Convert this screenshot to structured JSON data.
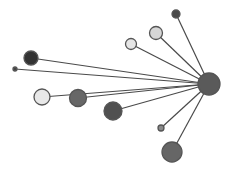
{
  "diagram": {
    "type": "star-network",
    "hub": {
      "id": "hub",
      "x": 209,
      "y": 84,
      "r": 11,
      "fill": "#5a5a5a"
    },
    "nodes": [
      {
        "id": "n1",
        "x": 15,
        "y": 69,
        "r": 2,
        "fill": "#444444"
      },
      {
        "id": "n2",
        "x": 31,
        "y": 58,
        "r": 7,
        "fill": "#333333"
      },
      {
        "id": "n3",
        "x": 42,
        "y": 97,
        "r": 8,
        "fill": "#e8e8e8"
      },
      {
        "id": "n4",
        "x": 78,
        "y": 98,
        "r": 8.5,
        "fill": "#676767"
      },
      {
        "id": "n5",
        "x": 113,
        "y": 111,
        "r": 9,
        "fill": "#505050"
      },
      {
        "id": "n6",
        "x": 131,
        "y": 44,
        "r": 5.5,
        "fill": "#e6e6e6"
      },
      {
        "id": "n7",
        "x": 156,
        "y": 33,
        "r": 6.5,
        "fill": "#d6d6d6"
      },
      {
        "id": "n8",
        "x": 176,
        "y": 14,
        "r": 4,
        "fill": "#4a4a4a"
      },
      {
        "id": "n9",
        "x": 161,
        "y": 128,
        "r": 3,
        "fill": "#8a8a8a"
      },
      {
        "id": "n10",
        "x": 172,
        "y": 152,
        "r": 10,
        "fill": "#666666"
      }
    ],
    "colors": {
      "edge": "#4a4a4a",
      "stroke": "#555555",
      "background": "#ffffff"
    }
  }
}
